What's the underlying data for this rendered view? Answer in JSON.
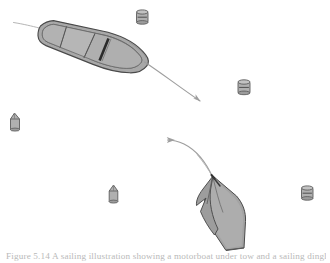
{
  "figure": {
    "caption": "Figure 5.14  A sailing illustration showing a motorboat under tow and a sailing dinghy",
    "background_color": "#ffffff",
    "hull_fill": "#a8a8a8",
    "hull_fill_light": "#b4b4b4",
    "hull_fill_dark": "#9a9a9a",
    "outline_color": "#4a4a4a",
    "arrow_color": "#9e9e9e",
    "rope_color": "#adadad",
    "buoy_fill": "#b0b0b0",
    "buoy_outline": "#5c5c5c",
    "dark_stripe_color": "#2b2b2b"
  },
  "scene": {
    "title": "Boats and channel buoys",
    "vessels": [
      {
        "id": "motorboat",
        "label": "Motorboat viewed from above",
        "position": "upper-left",
        "heading": "bow toward lower-right",
        "features": [
          "hull outline",
          "three interior thwart panels",
          "dark gunwale stripe",
          "tow line at stern"
        ]
      },
      {
        "id": "sailing-dinghy",
        "label": "Heeled sailing dinghy",
        "position": "lower-right",
        "heading": "bow toward upper-left",
        "features": [
          "heeled hull",
          "sail",
          "mast line"
        ]
      }
    ],
    "arrows": [
      {
        "id": "motorboat-course-arrow",
        "label": "Motorboat course arrow",
        "direction": "down-right",
        "style": "straight"
      },
      {
        "id": "dinghy-course-arrow",
        "label": "Dinghy course arrow",
        "direction": "up-left",
        "style": "curved"
      }
    ],
    "tow_line": {
      "id": "tow-line",
      "label": "Tow line from motorboat stern"
    },
    "buoys": [
      {
        "id": "buoy-1",
        "label": "Can buoy",
        "shape": "cylindrical",
        "position": "top-center"
      },
      {
        "id": "buoy-2",
        "label": "Can buoy",
        "shape": "cylindrical",
        "position": "right-upper"
      },
      {
        "id": "buoy-3",
        "label": "Conical buoy",
        "shape": "conical",
        "position": "left-middle"
      },
      {
        "id": "buoy-4",
        "label": "Conical buoy",
        "shape": "conical",
        "position": "center-lower"
      },
      {
        "id": "buoy-5",
        "label": "Can buoy",
        "shape": "cylindrical",
        "position": "right-lower"
      }
    ]
  }
}
